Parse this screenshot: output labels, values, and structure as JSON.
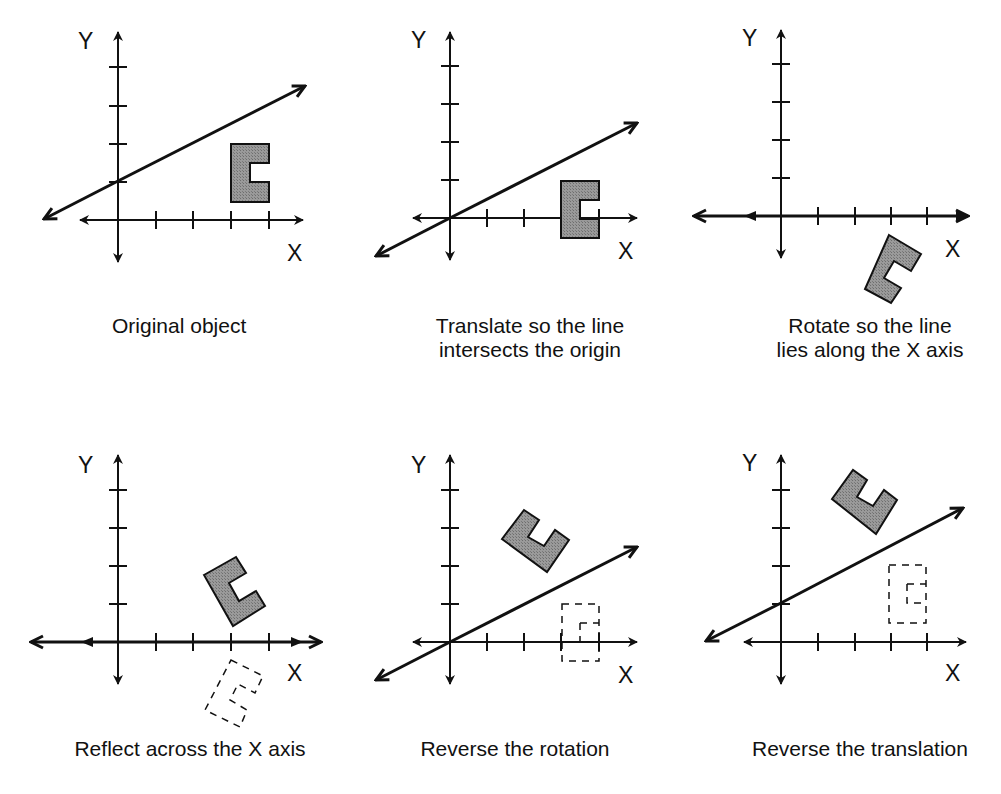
{
  "colors": {
    "ink": "#111111",
    "shape_fill": "#8c8c8c",
    "background": "#ffffff"
  },
  "axis_labels": {
    "x": "X",
    "y": "Y"
  },
  "panels": [
    {
      "id": 1,
      "caption": "Original object",
      "step": "original"
    },
    {
      "id": 2,
      "caption": "Translate so the line\nintersects the origin",
      "step": "translate"
    },
    {
      "id": 3,
      "caption": "Rotate so the line\nlies along the X axis",
      "step": "rotate"
    },
    {
      "id": 4,
      "caption": "Reflect across the X axis",
      "step": "reflect"
    },
    {
      "id": 5,
      "caption": "Reverse the rotation",
      "step": "reverse-rotation"
    },
    {
      "id": 6,
      "caption": "Reverse the translation",
      "step": "reverse-translation"
    }
  ]
}
